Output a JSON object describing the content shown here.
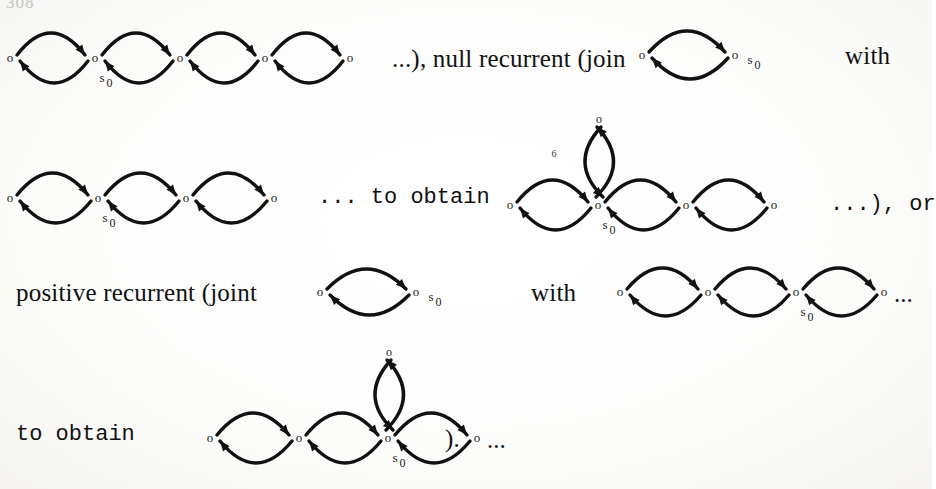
{
  "page": {
    "folio": "308",
    "background_color": "#fdfdfc",
    "ink_color": "#111111"
  },
  "text_runs": [
    {
      "id": "t1",
      "text": "...), null recurrent (join",
      "x": 392,
      "y": 58
    },
    {
      "id": "t2",
      "text": "with",
      "x": 845,
      "y": 55
    },
    {
      "id": "t3",
      "text": "... to obtain",
      "x": 318,
      "y": 198
    },
    {
      "id": "t4",
      "text": "...), or",
      "x": 830,
      "y": 205
    },
    {
      "id": "t5",
      "text": "positive recurrent (joint",
      "x": 16,
      "y": 292
    },
    {
      "id": "t6",
      "text": "with",
      "x": 531,
      "y": 292
    },
    {
      "id": "t7",
      "text": "to obtain",
      "x": 16,
      "y": 435
    },
    {
      "id": "t8",
      "text": ").",
      "x": 445,
      "y": 438
    }
  ],
  "node_label": "o",
  "start_state_label": {
    "letter": "s",
    "subscript": "0"
  },
  "stray_mark": "6",
  "ellipsis": "...",
  "graphs": [
    {
      "id": "g1",
      "name": "chain-5-nodes-line1",
      "description": "Five-state birth-death chain: five nodes joined by four bidirectional lens arc pairs. Start state s0 sits under the second node.",
      "nodes": 5,
      "lenses": 4,
      "start_state_index": 1,
      "start_state_position": "below",
      "vertical_loop": false,
      "trailing_ellipsis": false
    },
    {
      "id": "g2",
      "name": "two-node-join-line1",
      "description": "Two-state chain joined by a single bidirectional lens arc pair. Start state s0 labelled to the right of the second node.",
      "nodes": 2,
      "lenses": 1,
      "start_state_index": 1,
      "start_state_position": "right",
      "vertical_loop": false,
      "trailing_ellipsis": false
    },
    {
      "id": "g3",
      "name": "chain-4-nodes-line2",
      "description": "Four-state chain with three bidirectional lens arc pairs. Start state s0 under the second node.",
      "nodes": 4,
      "lenses": 3,
      "start_state_index": 1,
      "start_state_position": "below",
      "vertical_loop": false,
      "trailing_ellipsis": false
    },
    {
      "id": "g4",
      "name": "chain-4-nodes-vertical-loop-line2",
      "description": "Four-state chain with three lens arc pairs plus an extra vertical lens rising from the s0 node to a node above it.",
      "nodes": 4,
      "lenses": 3,
      "start_state_index": 1,
      "start_state_position": "below",
      "vertical_loop": true,
      "stray_mark": true,
      "trailing_ellipsis": false
    },
    {
      "id": "g5",
      "name": "two-node-joint-line3",
      "description": "Two-state chain joined by a single bidirectional lens arc pair. Start state s0 labelled to the right of the second node.",
      "nodes": 2,
      "lenses": 1,
      "start_state_index": 1,
      "start_state_position": "right",
      "vertical_loop": false,
      "trailing_ellipsis": false
    },
    {
      "id": "g6",
      "name": "chain-4-nodes-line3",
      "description": "Four-state chain with three lens arc pairs. Start state s0 under the third node, followed by a trailing ellipsis.",
      "nodes": 4,
      "lenses": 3,
      "start_state_index": 2,
      "start_state_position": "below",
      "vertical_loop": false,
      "trailing_ellipsis": true
    },
    {
      "id": "g7",
      "name": "chain-4-nodes-vertical-loop-line4",
      "description": "Four-state chain with three lens arc pairs plus a vertical lens rising from the s0 node. Start state s0 under the third node, trailing ellipsis at the end.",
      "nodes": 4,
      "lenses": 3,
      "start_state_index": 2,
      "start_state_position": "below",
      "vertical_loop": true,
      "trailing_ellipsis": true
    }
  ]
}
